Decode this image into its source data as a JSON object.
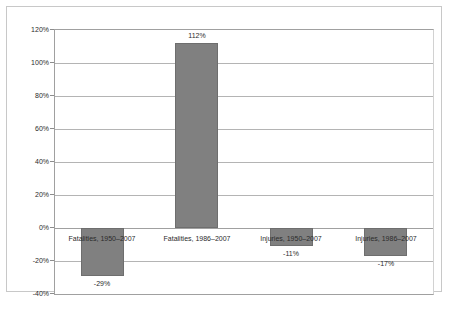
{
  "chart_data": {
    "type": "bar",
    "title": "",
    "subtitle": "",
    "xlabel": "",
    "ylabel": "",
    "categories": [
      "Fatalities, 1950–2007",
      "Fatalities, 1986–2007",
      "Injuries, 1950–2007",
      "Injuries, 1986–2007"
    ],
    "values": [
      -29,
      112,
      -11,
      -17
    ],
    "data_labels": [
      "-29%",
      "112%",
      "-11%",
      "-17%"
    ],
    "ylim": [
      -40,
      120
    ],
    "ytick_values": [
      120,
      100,
      80,
      60,
      40,
      20,
      0,
      -20,
      -40
    ],
    "ytick_labels": [
      "120%",
      "100%",
      "80%",
      "60%",
      "40%",
      "20%",
      "0%",
      "-20%",
      "-40%"
    ],
    "grid": true,
    "legend": false,
    "legend_position": "none",
    "bar_color": "#808080",
    "bar_border_color": "#6e6e6e",
    "gridline_color": "#b4b4b4",
    "axis_color": "#a0a0a0",
    "frame_color": "#c8c8c8",
    "text_color": "#2b2b2b"
  }
}
